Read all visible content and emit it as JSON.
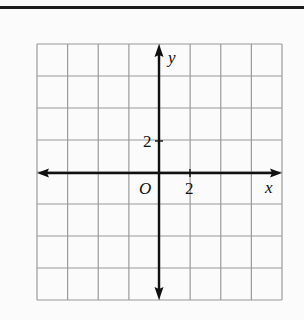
{
  "figure": {
    "type": "coordinate-plane",
    "grid": {
      "columns": 8,
      "rows": 8,
      "left": 37,
      "top": 44,
      "right": 282,
      "bottom": 300,
      "line_color": "#9a9a9a"
    },
    "axes": {
      "color": "#111111",
      "origin_px": [
        159,
        173
      ],
      "x_axis_label": "x",
      "y_axis_label": "y",
      "origin_label": "O",
      "x_tick_label": "2",
      "y_tick_label": "2",
      "units_per_cell": 2
    },
    "top_rule_color": "#1a1a1a",
    "background": "#fbfbfb"
  }
}
